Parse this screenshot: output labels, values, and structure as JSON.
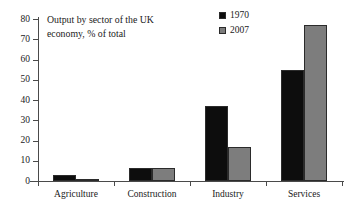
{
  "chart_data": {
    "type": "bar",
    "title": "Output by sector of the UK economy, % of total",
    "title_line1": "Output by sector of the UK",
    "title_line2": "economy, % of total",
    "xlabel": "",
    "ylabel": "",
    "ylim": [
      0,
      80
    ],
    "ytick_step": 10,
    "yticks": [
      0,
      10,
      20,
      30,
      40,
      50,
      60,
      70,
      80
    ],
    "ytick_labels": [
      "0",
      "10",
      "20",
      "30",
      "40",
      "50",
      "60",
      "70",
      "80"
    ],
    "categories": [
      "Agriculture",
      "Construction",
      "Industry",
      "Services"
    ],
    "grid": false,
    "legend_position": "top-right",
    "series": [
      {
        "name": "1970",
        "color": "#0d0d0d",
        "values": [
          3,
          6.5,
          37,
          55
        ]
      },
      {
        "name": "2007",
        "color": "#7d7d7d",
        "values": [
          1,
          6.5,
          17,
          77
        ]
      }
    ]
  },
  "legend": {
    "items": [
      {
        "label": "1970",
        "color": "#0d0d0d"
      },
      {
        "label": "2007",
        "color": "#7d7d7d"
      }
    ]
  },
  "colors": {
    "axis": "#4a4a4a",
    "text": "#1a1a1a",
    "background": "#ffffff",
    "series_1970": "#0d0d0d",
    "series_2007": "#7d7d7d"
  }
}
